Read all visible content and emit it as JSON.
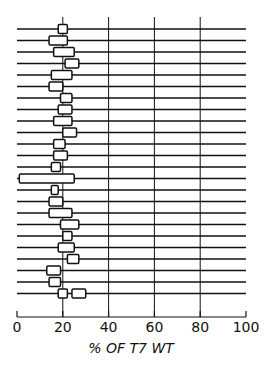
{
  "chart_data": {
    "type": "range-bar",
    "title": "",
    "xlabel": "% OF T7 WT",
    "ylabel": "",
    "xlim": [
      0,
      100
    ],
    "x_ticks": [
      0,
      20,
      40,
      60,
      80,
      100
    ],
    "x_tick_labels": [
      "0",
      "20",
      "40",
      "60",
      "80",
      "100"
    ],
    "grid": {
      "vertical_lines_at": [
        20,
        40,
        60,
        80
      ]
    },
    "row_count": 24,
    "rows": [
      {
        "row": 1,
        "boxes": [
          [
            18,
            22
          ]
        ]
      },
      {
        "row": 2,
        "boxes": [
          [
            14,
            22
          ]
        ]
      },
      {
        "row": 3,
        "boxes": [
          [
            16,
            25
          ]
        ]
      },
      {
        "row": 4,
        "boxes": [
          [
            21,
            27
          ]
        ]
      },
      {
        "row": 5,
        "boxes": [
          [
            15,
            24
          ]
        ]
      },
      {
        "row": 6,
        "boxes": [
          [
            14,
            20
          ]
        ]
      },
      {
        "row": 7,
        "boxes": [
          [
            19,
            24
          ]
        ]
      },
      {
        "row": 8,
        "boxes": [
          [
            18,
            24
          ]
        ]
      },
      {
        "row": 9,
        "boxes": [
          [
            16,
            24
          ]
        ]
      },
      {
        "row": 10,
        "boxes": [
          [
            20,
            26
          ]
        ]
      },
      {
        "row": 11,
        "boxes": [
          [
            16,
            21
          ]
        ]
      },
      {
        "row": 12,
        "boxes": [
          [
            16,
            22
          ]
        ]
      },
      {
        "row": 13,
        "boxes": [
          [
            15,
            19
          ]
        ]
      },
      {
        "row": 14,
        "boxes": [
          [
            1,
            25
          ]
        ]
      },
      {
        "row": 15,
        "boxes": [
          [
            15,
            18
          ]
        ]
      },
      {
        "row": 16,
        "boxes": [
          [
            14,
            20
          ]
        ]
      },
      {
        "row": 17,
        "boxes": [
          [
            14,
            24
          ]
        ]
      },
      {
        "row": 18,
        "boxes": [
          [
            19,
            27
          ]
        ]
      },
      {
        "row": 19,
        "boxes": [
          [
            20,
            24
          ]
        ]
      },
      {
        "row": 20,
        "boxes": [
          [
            18,
            25
          ]
        ]
      },
      {
        "row": 21,
        "boxes": [
          [
            22,
            27
          ]
        ]
      },
      {
        "row": 22,
        "boxes": [
          [
            13,
            19
          ]
        ]
      },
      {
        "row": 23,
        "boxes": [
          [
            14,
            19
          ]
        ]
      },
      {
        "row": 24,
        "boxes": [
          [
            18,
            22
          ],
          [
            24,
            30
          ]
        ]
      }
    ]
  },
  "style": {
    "line_color": "#111111",
    "background": "#ffffff"
  }
}
